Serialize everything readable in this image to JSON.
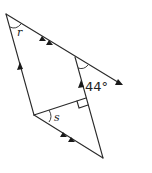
{
  "diagram": {
    "type": "geometry-parallel-lines",
    "labels": {
      "angle_r": "r",
      "angle_s": "s",
      "angle_given": "44°"
    },
    "markers": {
      "single_arrow_pair": "left edge and middle vertical line are parallel",
      "double_arrow_pair": "top line and lower-left line are parallel",
      "right_angle": "perpendicular at inner segment meeting right line"
    },
    "colors": {
      "stroke": "#2a2a2a",
      "background": "#ffffff"
    }
  }
}
